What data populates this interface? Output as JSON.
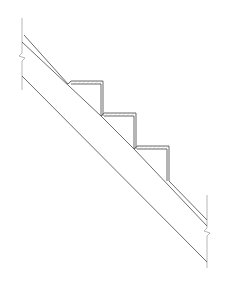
{
  "drawing": {
    "type": "stair-section-detail",
    "stroke_color": "#5a5a5a",
    "light_stroke_color": "#9a9a9a",
    "background": "#ffffff",
    "steps": 3,
    "break_lines": 2
  }
}
